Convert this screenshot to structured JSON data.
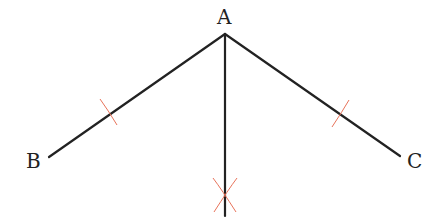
{
  "diagram": {
    "points": {
      "A": {
        "label": "A",
        "x": 225,
        "y": 34
      },
      "B": {
        "label": "B",
        "x": 49,
        "y": 157
      },
      "C": {
        "label": "C",
        "x": 400,
        "y": 156
      },
      "D": {
        "x": 225,
        "y": 216
      }
    },
    "labels": {
      "A": "A",
      "B": "B",
      "C": "C"
    },
    "colors": {
      "line": "#222222",
      "arc": "#e8735a"
    },
    "segments": [
      {
        "from": "A",
        "to": "B"
      },
      {
        "from": "A",
        "to": "C"
      },
      {
        "from": "A",
        "to": "D",
        "type": "bisector"
      }
    ],
    "arc_marks": [
      {
        "on": "AB",
        "x": 110,
        "y": 113
      },
      {
        "on": "AC",
        "x": 340,
        "y": 115
      },
      {
        "on": "bisector",
        "x": 225,
        "y": 195,
        "type": "cross"
      }
    ]
  }
}
